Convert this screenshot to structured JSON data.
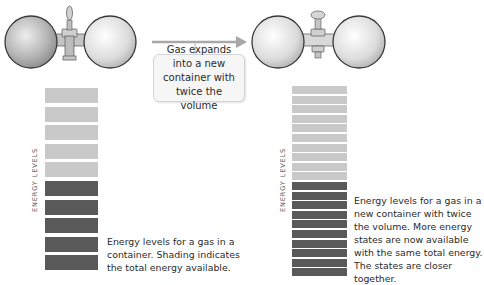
{
  "callout": {
    "text": "Gas expands into a new container with twice the volume"
  },
  "left_panel": {
    "axis_label": "ENERGY LEVELS",
    "caption": "Energy levels for a gas in a container. Shading indicates the total energy available.",
    "levels_total": 10,
    "levels_filled": 5
  },
  "right_panel": {
    "axis_label": "ENERGY LEVELS",
    "caption": "Energy levels for a gas in a new container with twice the volume. More energy states are now available with the same total energy. The states are closer together.",
    "levels_total": 20,
    "levels_filled": 10
  },
  "colors": {
    "empty_level": "#c9c9c9",
    "filled_level": "#595959",
    "arrow": "#a8a8a8",
    "sphere_left_fill": "#a9a9a9",
    "sphere_right_fill": "#d8d8d8"
  }
}
